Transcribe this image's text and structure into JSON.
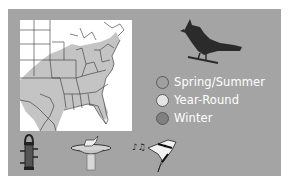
{
  "legend": {
    "items": [
      {
        "label": "Spring/Summer",
        "color": "#a0a0a0"
      },
      {
        "label": "Year-Round",
        "color": "#e4e4e4"
      },
      {
        "label": "Winter",
        "color": "#808080"
      }
    ]
  },
  "icons": {
    "bird": "cardinal-silhouette-icon",
    "feeder": "tube-feeder-icon",
    "bath": "birdbath-icon",
    "song": "singing-bird-icon"
  },
  "colors": {
    "panel": "#a4a4a4",
    "range_fill": "#c4c4c4",
    "map_bg": "#ffffff",
    "label_text": "#ffffff"
  }
}
